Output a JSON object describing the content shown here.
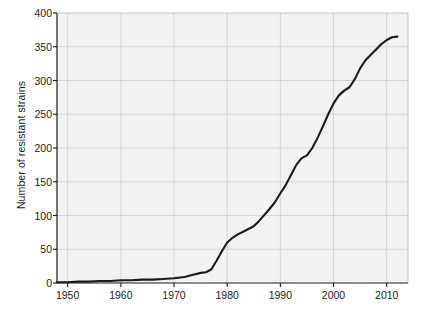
{
  "chart_data": {
    "type": "line",
    "title": "",
    "subtitle": "",
    "xlabel": "",
    "ylabel": "Number of resistant strains",
    "xlim": [
      1948,
      2014
    ],
    "ylim": [
      0,
      400
    ],
    "xticks": [
      1950,
      1960,
      1970,
      1980,
      1990,
      2000,
      2010
    ],
    "xtick_labels": [
      "1950",
      "1960",
      "1970",
      "1980",
      "1990",
      "2000",
      "2010"
    ],
    "yticks": [
      0,
      50,
      100,
      150,
      200,
      250,
      300,
      350,
      400
    ],
    "ytick_labels": [
      "0",
      "50",
      "100",
      "150",
      "200",
      "250",
      "300",
      "350",
      "400"
    ],
    "grid": true,
    "legend": null,
    "series": [
      {
        "name": "Number of resistant strains",
        "color": "#1a1a1a",
        "x": [
          1948,
          1950,
          1952,
          1954,
          1956,
          1958,
          1960,
          1962,
          1964,
          1966,
          1968,
          1970,
          1972,
          1973,
          1974,
          1975,
          1976,
          1977,
          1978,
          1979,
          1980,
          1981,
          1982,
          1983,
          1984,
          1985,
          1986,
          1987,
          1988,
          1989,
          1990,
          1991,
          1992,
          1993,
          1994,
          1995,
          1996,
          1997,
          1998,
          1999,
          2000,
          2001,
          2002,
          2003,
          2004,
          2005,
          2006,
          2007,
          2008,
          2009,
          2010,
          2011,
          2012
        ],
        "y": [
          1,
          1,
          2,
          2,
          3,
          3,
          4,
          4,
          5,
          5,
          6,
          7,
          9,
          11,
          13,
          15,
          16,
          20,
          33,
          47,
          60,
          67,
          72,
          76,
          80,
          84,
          92,
          101,
          110,
          120,
          133,
          145,
          160,
          175,
          185,
          189,
          200,
          215,
          232,
          250,
          266,
          278,
          285,
          290,
          302,
          318,
          330,
          338,
          346,
          354,
          360,
          364,
          365
        ]
      }
    ]
  },
  "axes": {
    "plot_bg": "#f2f2f2",
    "grid_color": "#c8c8c8",
    "axis_color": "#1a1a1a",
    "line_color": "#1a1a1a"
  }
}
